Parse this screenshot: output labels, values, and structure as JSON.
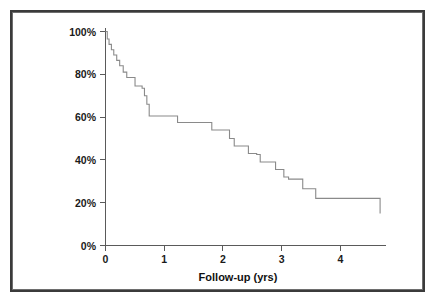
{
  "figure": {
    "background_color": "#ffffff",
    "frame_color": "#3b3b3b",
    "curve_color": "#8a8a8a",
    "axis_color": "#5a5a5a"
  },
  "chart_data": {
    "type": "line",
    "subtype": "kaplan-meier-step",
    "title": "",
    "subtitle": "",
    "xlabel": "Follow-up (yrs)",
    "ylabel": "",
    "xlim": [
      0,
      4.75
    ],
    "ylim": [
      0,
      100
    ],
    "grid": false,
    "legend": null,
    "legend_position": "none",
    "x_tick_values": [
      0,
      1,
      2,
      3,
      4
    ],
    "x_tick_labels": [
      "0",
      "1",
      "2",
      "3",
      "4"
    ],
    "y_tick_values": [
      0,
      20,
      40,
      60,
      80,
      100
    ],
    "y_tick_labels": [
      "0%",
      "20%",
      "40%",
      "60%",
      "80%",
      "100%"
    ],
    "y_unit": "%",
    "annotations": [],
    "series": [
      {
        "name": "survival",
        "x": [
          0.0,
          0.03,
          0.05,
          0.09,
          0.12,
          0.16,
          0.2,
          0.24,
          0.28,
          0.34,
          0.4,
          0.47,
          0.55,
          0.62,
          0.66,
          0.69,
          0.72,
          1.22,
          1.78,
          2.08,
          2.14,
          2.36,
          2.48,
          2.58,
          2.76,
          2.88,
          3.02,
          3.08,
          3.3,
          3.5,
          3.58,
          4.62,
          4.65
        ],
        "y": [
          100.0,
          96.5,
          94.5,
          92.0,
          90.0,
          88.0,
          86.0,
          84.0,
          81.0,
          79.0,
          78.5,
          75.5,
          74.5,
          73.5,
          70.5,
          67.0,
          60.5,
          60.5,
          57.5,
          57.5,
          54.0,
          54.0,
          50.0,
          47.0,
          46.5,
          43.0,
          42.5,
          39.5,
          39.0,
          35.5,
          35.0,
          32.0,
          31.5
        ],
        "step": "post"
      }
    ],
    "steps": [
      {
        "x": 0.0,
        "survival_pct": 100.0
      },
      {
        "x": 0.03,
        "survival_pct": 96.5
      },
      {
        "x": 0.06,
        "survival_pct": 94.0
      },
      {
        "x": 0.1,
        "survival_pct": 91.5
      },
      {
        "x": 0.14,
        "survival_pct": 89.0
      },
      {
        "x": 0.19,
        "survival_pct": 86.5
      },
      {
        "x": 0.24,
        "survival_pct": 84.0
      },
      {
        "x": 0.3,
        "survival_pct": 81.0
      },
      {
        "x": 0.36,
        "survival_pct": 78.5
      },
      {
        "x": 0.5,
        "survival_pct": 74.5
      },
      {
        "x": 0.62,
        "survival_pct": 73.5
      },
      {
        "x": 0.66,
        "survival_pct": 70.0
      },
      {
        "x": 0.7,
        "survival_pct": 66.0
      },
      {
        "x": 0.74,
        "survival_pct": 60.5
      },
      {
        "x": 1.22,
        "survival_pct": 57.5
      },
      {
        "x": 1.8,
        "survival_pct": 54.0
      },
      {
        "x": 2.1,
        "survival_pct": 50.0
      },
      {
        "x": 2.18,
        "survival_pct": 46.5
      },
      {
        "x": 2.42,
        "survival_pct": 43.0
      },
      {
        "x": 2.56,
        "survival_pct": 42.5
      },
      {
        "x": 2.62,
        "survival_pct": 39.0
      },
      {
        "x": 2.88,
        "survival_pct": 35.5
      },
      {
        "x": 3.02,
        "survival_pct": 32.0
      },
      {
        "x": 3.1,
        "survival_pct": 31.0
      },
      {
        "x": 3.34,
        "survival_pct": 26.5
      },
      {
        "x": 3.56,
        "survival_pct": 22.0
      },
      {
        "x": 4.62,
        "survival_pct": 22.0
      },
      {
        "x": 4.65,
        "survival_pct": 15.0
      }
    ],
    "notes": {
      "start_value_pct": 100,
      "plateau_value_pct": 22,
      "final_value_pct": 15,
      "max_followup_yrs": 4.65
    }
  },
  "axes": {
    "x_title": "Follow-up (yrs)",
    "x_ticks": [
      "0",
      "1",
      "2",
      "3",
      "4"
    ],
    "y_ticks": [
      "100%",
      "80%",
      "60%",
      "40%",
      "20%",
      "0%"
    ]
  }
}
